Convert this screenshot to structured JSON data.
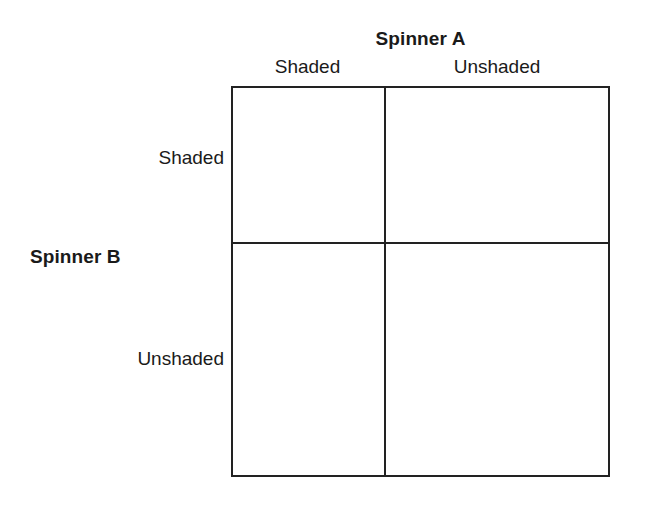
{
  "figure": {
    "type": "two-way-table",
    "column_group_label": "Spinner A",
    "row_group_label": "Spinner B",
    "column_headers": [
      "Shaded",
      "Unshaded"
    ],
    "row_headers": [
      "Shaded",
      "Unshaded"
    ],
    "cells": [
      [
        "",
        ""
      ],
      [
        "",
        ""
      ]
    ],
    "colors": {
      "background": "#ffffff",
      "line": "#222222",
      "text": "#1a1a1a"
    }
  }
}
